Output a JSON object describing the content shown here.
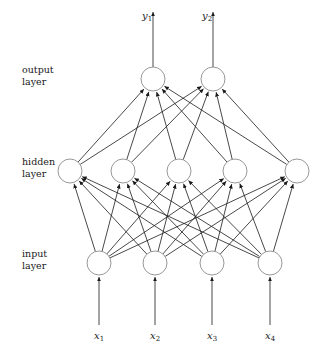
{
  "diagram": {
    "background_color": "#ffffff",
    "node_stroke_color": "#8c8c8c",
    "node_fill_color": "#ffffff",
    "edge_color": "#1a1a1a",
    "text_color": "#1a1a1a",
    "node_radius": 12,
    "layers": [
      {
        "id": "output",
        "label_line1": "output",
        "label_line2": "layer",
        "label_x": 22,
        "label_y": 64,
        "node_y": 79,
        "node_count": 2,
        "node_xs": [
          153,
          213
        ]
      },
      {
        "id": "hidden",
        "label_line1": "hidden",
        "label_line2": "layer",
        "label_x": 22,
        "label_y": 156,
        "node_y": 171,
        "node_count": 5,
        "node_xs": [
          70,
          123,
          179,
          235,
          297
        ]
      },
      {
        "id": "input",
        "label_line1": "input",
        "label_line2": "layer",
        "label_x": 22,
        "label_y": 248,
        "node_y": 263,
        "node_count": 4,
        "node_xs": [
          99,
          155,
          212,
          270
        ]
      }
    ],
    "outputs": [
      {
        "symbol": "y",
        "subscript": "1",
        "label_x": 142,
        "label_y": 10,
        "arrow_x": 153,
        "arrow_from_y": 67,
        "arrow_to_y": 12
      },
      {
        "symbol": "y",
        "subscript": "2",
        "label_x": 202,
        "label_y": 10,
        "arrow_x": 213,
        "arrow_from_y": 67,
        "arrow_to_y": 12
      }
    ],
    "inputs": [
      {
        "symbol": "x",
        "subscript": "1",
        "label_x": 94,
        "label_y": 330,
        "arrow_x": 99,
        "arrow_from_y": 325,
        "arrow_to_y": 277
      },
      {
        "symbol": "x",
        "subscript": "2",
        "label_x": 150,
        "label_y": 330,
        "arrow_x": 155,
        "arrow_from_y": 325,
        "arrow_to_y": 277
      },
      {
        "symbol": "x",
        "subscript": "3",
        "label_x": 207,
        "label_y": 330,
        "arrow_x": 212,
        "arrow_from_y": 325,
        "arrow_to_y": 277
      },
      {
        "symbol": "x",
        "subscript": "4",
        "label_x": 265,
        "label_y": 330,
        "arrow_x": 270,
        "arrow_from_y": 325,
        "arrow_to_y": 277
      }
    ],
    "connections": {
      "input_to_hidden": "fully-connected",
      "hidden_to_output": "fully-connected",
      "input_to_hidden_count": 20,
      "hidden_to_output_count": 10,
      "direction": "upward"
    }
  }
}
